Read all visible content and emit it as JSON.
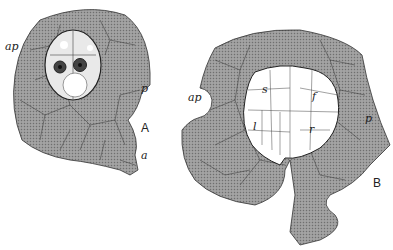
{
  "figure": {
    "panels": [
      {
        "id": "A",
        "label": "A",
        "annotations": {
          "ap": "ap",
          "p": "p",
          "a": "a"
        }
      },
      {
        "id": "B",
        "label": "B",
        "annotations": {
          "ap": "ap",
          "p": "p",
          "s": "s",
          "f": "f",
          "l": "l",
          "r": "r"
        }
      }
    ]
  }
}
